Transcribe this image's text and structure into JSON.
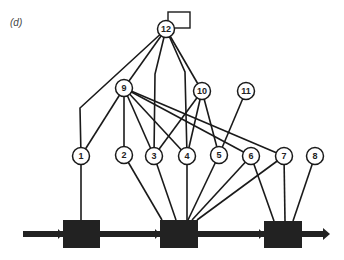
{
  "figure": {
    "panel_label": "(d)",
    "colors": {
      "stroke": "#1a1a1a",
      "box_fill": "#222222",
      "node_fill": "#ffffff",
      "background": "#ffffff"
    },
    "nodes": [
      {
        "id": "1",
        "x": 81,
        "y": 156
      },
      {
        "id": "2",
        "x": 124,
        "y": 155
      },
      {
        "id": "3",
        "x": 154,
        "y": 156
      },
      {
        "id": "4",
        "x": 187,
        "y": 156
      },
      {
        "id": "5",
        "x": 219,
        "y": 155
      },
      {
        "id": "6",
        "x": 251,
        "y": 156
      },
      {
        "id": "7",
        "x": 284,
        "y": 156
      },
      {
        "id": "8",
        "x": 315,
        "y": 156
      },
      {
        "id": "9",
        "x": 124,
        "y": 88
      },
      {
        "id": "10",
        "x": 202,
        "y": 91
      },
      {
        "id": "11",
        "x": 246,
        "y": 91
      },
      {
        "id": "12",
        "x": 166,
        "y": 29
      }
    ],
    "attached_square": {
      "x": 168,
      "y": 12,
      "w": 22,
      "h": 16
    },
    "boxes": [
      {
        "id": "box-1",
        "x": 63,
        "y": 220,
        "w": 37,
        "h": 28
      },
      {
        "id": "box-2",
        "x": 160,
        "y": 220,
        "w": 38,
        "h": 28
      },
      {
        "id": "box-3",
        "x": 264,
        "y": 221,
        "w": 38,
        "h": 27
      }
    ],
    "edges": [
      {
        "from": "12",
        "to": "1",
        "via": [
          [
            80,
            108
          ]
        ]
      },
      {
        "from": "12",
        "to": "9"
      },
      {
        "from": "12",
        "to": "3",
        "via": [
          [
            155,
            74
          ]
        ]
      },
      {
        "from": "12",
        "to": "4",
        "via": [
          [
            185,
            72
          ]
        ]
      },
      {
        "from": "12",
        "to": "10"
      },
      {
        "from": "9",
        "to": "1"
      },
      {
        "from": "9",
        "to": "2"
      },
      {
        "from": "9",
        "to": "3"
      },
      {
        "from": "9",
        "to": "4"
      },
      {
        "from": "9",
        "to": "6"
      },
      {
        "from": "9",
        "to": "7"
      },
      {
        "from": "10",
        "to": "3"
      },
      {
        "from": "10",
        "to": "4"
      },
      {
        "from": "10",
        "to": "5"
      },
      {
        "from": "11",
        "to": "5"
      },
      {
        "from": "1",
        "to": "box-1",
        "end": [
          81,
          220
        ]
      },
      {
        "from": "2",
        "to": "box-2",
        "end": [
          162,
          220
        ]
      },
      {
        "from": "3",
        "to": "box-2",
        "end": [
          176,
          220
        ]
      },
      {
        "from": "4",
        "to": "box-2",
        "end": [
          187,
          220
        ]
      },
      {
        "from": "5",
        "to": "box-2",
        "end": [
          188,
          220
        ]
      },
      {
        "from": "6",
        "to": "box-2",
        "end": [
          192,
          220
        ]
      },
      {
        "from": "7",
        "to": "box-2",
        "end": [
          197,
          220
        ]
      },
      {
        "from": "6",
        "to": "box-3",
        "end": [
          274,
          221
        ]
      },
      {
        "from": "7",
        "to": "box-3",
        "end": [
          285,
          221
        ]
      },
      {
        "from": "8",
        "to": "box-3",
        "end": [
          293,
          221
        ]
      }
    ],
    "backbone_arrow": {
      "x1": 23,
      "x2": 330,
      "y": 234
    }
  }
}
